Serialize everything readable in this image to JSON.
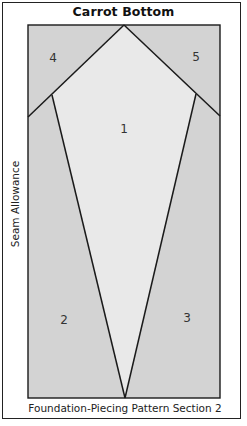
{
  "title": "Carrot Bottom",
  "side_label": "Seam Allowance",
  "caption": "Foundation-Piecing Pattern Section 2",
  "colors": {
    "outer_fill": "#d3d3d3",
    "center_fill": "#e9e9e9",
    "line": "#1a1a1a",
    "frame": "#222222"
  },
  "pieces": [
    {
      "id": "1",
      "label": "1",
      "label_x": 124,
      "label_y": 133
    },
    {
      "id": "2",
      "label": "2",
      "label_x": 64,
      "label_y": 324
    },
    {
      "id": "3",
      "label": "3",
      "label_x": 187,
      "label_y": 322
    },
    {
      "id": "4",
      "label": "4",
      "label_x": 53,
      "label_y": 62
    },
    {
      "id": "5",
      "label": "5",
      "label_x": 196,
      "label_y": 61
    }
  ]
}
